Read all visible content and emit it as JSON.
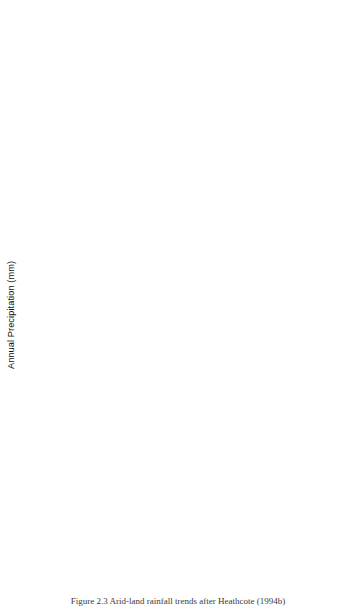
{
  "figure": {
    "caption": "Figure 2.3 Arid-land rainfall trends after Heathcote (1994b)",
    "ylabel": "Annual Precipitation (mm)",
    "xlabel": "",
    "x_tick_labels": [
      "1945",
      "1950",
      "1955",
      "1960",
      "1965",
      "1970",
      "1975"
    ],
    "x_range": [
      1945,
      1975
    ]
  },
  "chart_data": [
    {
      "type": "line",
      "title": "Agadez, Niger",
      "xlabel": "",
      "ylabel": "Annual Precipitation (mm)",
      "xlim": [
        1945,
        1975
      ],
      "ylim": [
        0,
        300
      ],
      "yticks": [
        0,
        300
      ],
      "ytick_labels": [
        "0",
        "300"
      ],
      "minor_yticks": [
        100,
        200
      ],
      "grid": false,
      "annotation": "Linear trend, 1957 - 73",
      "x": [
        1945,
        1946,
        1947,
        1948,
        1949,
        1950,
        1951,
        1952,
        1953,
        1954,
        1955,
        1956,
        1957,
        1958,
        1959,
        1960,
        1961,
        1962,
        1963,
        1964,
        1965,
        1966,
        1967,
        1968,
        1969,
        1970,
        1971,
        1972,
        1973,
        1974
      ],
      "values": [
        240,
        155,
        275,
        75,
        130,
        270,
        115,
        175,
        300,
        215,
        185,
        140,
        305,
        160,
        185,
        215,
        160,
        170,
        180,
        155,
        180,
        140,
        185,
        185,
        150,
        75,
        105,
        130,
        125,
        170
      ],
      "trend": {
        "style": "solid",
        "x": [
          1957,
          1973
        ],
        "y": [
          232,
          90
        ]
      }
    },
    {
      "type": "line",
      "title": "Abeche, Chad",
      "xlabel": "",
      "ylabel": "Annual Precipitation (mm)",
      "xlim": [
        1945,
        1975
      ],
      "ylim": [
        0,
        800
      ],
      "yticks": [
        0,
        800
      ],
      "ytick_labels": [
        "0",
        "800"
      ],
      "minor_yticks": [
        200,
        400,
        600
      ],
      "grid": false,
      "annotation": "Linear trend, 1957 - 73",
      "x": [
        1945,
        1946,
        1947,
        1948,
        1949,
        1950,
        1951,
        1952,
        1953,
        1954,
        1955,
        1956,
        1957,
        1958,
        1959,
        1960,
        1961,
        1962,
        1963,
        1964,
        1965,
        1966,
        1967,
        1968,
        1969,
        1970,
        1971,
        1972,
        1973,
        1974
      ],
      "values": [
        330,
        560,
        845,
        510,
        310,
        305,
        305,
        800,
        670,
        560,
        610,
        450,
        420,
        490,
        520,
        480,
        560,
        620,
        430,
        500,
        540,
        520,
        475,
        700,
        360,
        355,
        310,
        290,
        400,
        290
      ],
      "trend": {
        "style": "dashed",
        "x": [
          1957,
          1973
        ],
        "y": [
          735,
          430
        ]
      },
      "trend2": {
        "style": "solid",
        "x": [
          1957,
          1975
        ],
        "y": [
          540,
          290
        ]
      }
    },
    {
      "type": "line",
      "title": "Alice Springs, Australia",
      "xlabel": "",
      "ylabel": "Annual Precipitation (mm)",
      "xlim": [
        1945,
        1975
      ],
      "ylim": [
        0,
        800
      ],
      "yticks": [
        0,
        800
      ],
      "ytick_labels": [
        "0",
        "800"
      ],
      "minor_yticks": [
        200,
        400,
        600
      ],
      "grid": false,
      "annotation": "Linear trend, 1945 - 65",
      "x": [
        1945,
        1946,
        1947,
        1948,
        1949,
        1950,
        1951,
        1952,
        1953,
        1954,
        1955,
        1956,
        1957,
        1958,
        1959,
        1960,
        1961,
        1962,
        1963,
        1964,
        1965,
        1966,
        1967,
        1968,
        1969,
        1970,
        1971,
        1972,
        1973,
        1974
      ],
      "values": [
        215,
        300,
        390,
        240,
        300,
        145,
        265,
        230,
        235,
        235,
        200,
        275,
        175,
        180,
        170,
        155,
        95,
        165,
        110,
        120,
        85,
        295,
        220,
        370,
        195,
        190,
        175,
        160,
        105,
        775
      ],
      "trend": {
        "style": "solid",
        "x": [
          1945,
          1965
        ],
        "y": [
          300,
          105
        ]
      },
      "trend2": {
        "style": "dashed",
        "x": [
          1965,
          1974
        ],
        "y": [
          105,
          15
        ]
      }
    },
    {
      "type": "line",
      "title": "Jodhpur, India",
      "xlabel": "",
      "ylabel": "Annual Precipitation (mm)",
      "xlim": [
        1945,
        1975
      ],
      "ylim": [
        0,
        600
      ],
      "yticks": [
        0,
        600
      ],
      "ytick_labels": [
        "0",
        "600"
      ],
      "minor_yticks": [
        200,
        400
      ],
      "grid": false,
      "annotation": "Constant mean value, 1945 - 74",
      "x": [
        1945,
        1946,
        1947,
        1948,
        1949,
        1950,
        1951,
        1952,
        1953,
        1954,
        1955,
        1956,
        1957,
        1958,
        1959,
        1960,
        1961,
        1962,
        1963,
        1964,
        1965,
        1966,
        1967,
        1968,
        1969,
        1970,
        1971,
        1972,
        1973,
        1974
      ],
      "values": [
        495,
        220,
        310,
        305,
        195,
        255,
        290,
        380,
        340,
        345,
        320,
        520,
        275,
        310,
        315,
        150,
        310,
        300,
        205,
        320,
        290,
        360,
        610,
        160,
        160,
        460,
        320,
        290,
        620,
        310
      ],
      "mean": {
        "value": 305,
        "style": "constant"
      }
    },
    {
      "type": "line",
      "title": "Phoenix, United States",
      "xlabel": "",
      "ylabel": "Annual Precipitation (mm)",
      "xlim": [
        1945,
        1975
      ],
      "ylim": [
        0,
        300
      ],
      "yticks": [
        0,
        300
      ],
      "ytick_labels": [
        "0",
        "300"
      ],
      "minor_yticks": [
        100,
        200
      ],
      "grid": false,
      "annotation": "Constant mean values, 1945 - 74",
      "x": [
        1945,
        1946,
        1947,
        1948,
        1949,
        1950,
        1951,
        1952,
        1953,
        1954,
        1955,
        1956,
        1957,
        1958,
        1959,
        1960,
        1961,
        1962,
        1963,
        1964,
        1965,
        1966,
        1967,
        1968,
        1969,
        1970,
        1971,
        1972,
        1973,
        1974
      ],
      "values": [
        95,
        230,
        65,
        80,
        155,
        90,
        300,
        215,
        80,
        125,
        240,
        55,
        195,
        205,
        210,
        100,
        90,
        115,
        190,
        180,
        290,
        175,
        205,
        160,
        160,
        195,
        75,
        280,
        145,
        210
      ],
      "mean": {
        "value": 168,
        "style": "constant"
      }
    }
  ]
}
